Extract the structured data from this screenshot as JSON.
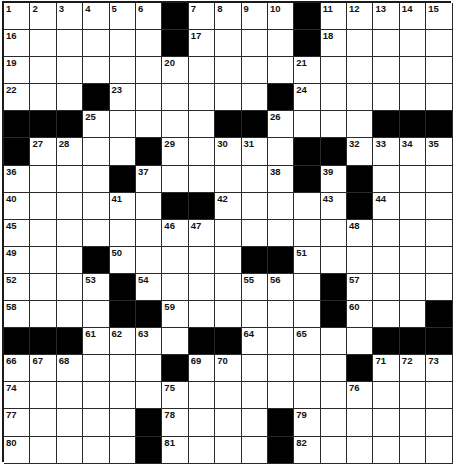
{
  "puzzle": {
    "rows": 17,
    "cols": 17,
    "colors": {
      "black": "#000000",
      "white": "#ffffff",
      "line": "#2a2a2a"
    },
    "grid": [
      "......#....#.....",
      "......#....#.....",
      ".................",
      "...#......#......",
      "###.....##....###",
      "#....#.....##....",
      "....#......#.#...",
      "......##.....#...",
      ".................",
      "...#.....##......",
      "....#.......#....",
      "....##......#...#",
      "###....##.....###",
      "......#......#...",
      ".................",
      ".....#....#......",
      ".....#....#......"
    ],
    "numbers": [
      [
        0,
        0,
        1
      ],
      [
        0,
        1,
        2
      ],
      [
        0,
        2,
        3
      ],
      [
        0,
        3,
        4
      ],
      [
        0,
        4,
        5
      ],
      [
        0,
        5,
        6
      ],
      [
        0,
        7,
        7
      ],
      [
        0,
        8,
        8
      ],
      [
        0,
        9,
        9
      ],
      [
        0,
        10,
        10
      ],
      [
        0,
        12,
        11
      ],
      [
        0,
        13,
        12
      ],
      [
        0,
        14,
        13
      ],
      [
        0,
        15,
        14
      ],
      [
        0,
        16,
        15
      ],
      [
        1,
        0,
        16
      ],
      [
        1,
        7,
        17
      ],
      [
        1,
        12,
        18
      ],
      [
        2,
        0,
        19
      ],
      [
        2,
        6,
        20
      ],
      [
        2,
        11,
        21
      ],
      [
        3,
        0,
        22
      ],
      [
        3,
        4,
        23
      ],
      [
        3,
        11,
        24
      ],
      [
        4,
        3,
        25
      ],
      [
        4,
        10,
        26
      ],
      [
        5,
        1,
        27
      ],
      [
        5,
        2,
        28
      ],
      [
        5,
        6,
        29
      ],
      [
        5,
        8,
        30
      ],
      [
        5,
        9,
        31
      ],
      [
        5,
        13,
        32
      ],
      [
        5,
        14,
        33
      ],
      [
        5,
        15,
        34
      ],
      [
        5,
        16,
        35
      ],
      [
        6,
        0,
        36
      ],
      [
        6,
        5,
        37
      ],
      [
        6,
        10,
        38
      ],
      [
        6,
        12,
        39
      ],
      [
        7,
        0,
        40
      ],
      [
        7,
        4,
        41
      ],
      [
        7,
        8,
        42
      ],
      [
        7,
        12,
        43
      ],
      [
        7,
        14,
        44
      ],
      [
        8,
        0,
        45
      ],
      [
        8,
        6,
        46
      ],
      [
        8,
        7,
        47
      ],
      [
        8,
        13,
        48
      ],
      [
        9,
        0,
        49
      ],
      [
        9,
        4,
        50
      ],
      [
        9,
        11,
        51
      ],
      [
        10,
        0,
        52
      ],
      [
        10,
        3,
        53
      ],
      [
        10,
        5,
        54
      ],
      [
        10,
        9,
        55
      ],
      [
        10,
        10,
        56
      ],
      [
        10,
        13,
        57
      ],
      [
        11,
        0,
        58
      ],
      [
        11,
        6,
        59
      ],
      [
        11,
        13,
        60
      ],
      [
        12,
        3,
        61
      ],
      [
        12,
        4,
        62
      ],
      [
        12,
        5,
        63
      ],
      [
        12,
        9,
        64
      ],
      [
        12,
        11,
        65
      ],
      [
        13,
        0,
        66
      ],
      [
        13,
        1,
        67
      ],
      [
        13,
        2,
        68
      ],
      [
        13,
        7,
        69
      ],
      [
        13,
        8,
        70
      ],
      [
        13,
        14,
        71
      ],
      [
        13,
        15,
        72
      ],
      [
        13,
        16,
        73
      ],
      [
        14,
        0,
        74
      ],
      [
        14,
        6,
        75
      ],
      [
        14,
        13,
        76
      ],
      [
        15,
        0,
        77
      ],
      [
        15,
        6,
        78
      ],
      [
        15,
        11,
        79
      ],
      [
        16,
        0,
        80
      ],
      [
        16,
        6,
        81
      ],
      [
        16,
        11,
        82
      ]
    ]
  }
}
